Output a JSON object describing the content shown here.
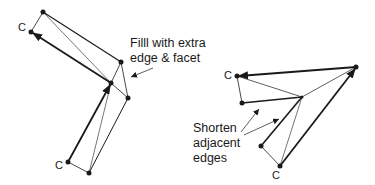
{
  "diagram": {
    "left_figure": {
      "annotation": [
        "Filll with extra",
        "edge & facet"
      ],
      "corner_labels": [
        "C",
        "C"
      ]
    },
    "right_figure": {
      "annotation": [
        "Shorten",
        "adjacent",
        "edges"
      ],
      "corner_labels": [
        "C",
        "C"
      ]
    },
    "colors": {
      "stroke": "#1a1a1a",
      "background": "#ffffff"
    }
  }
}
